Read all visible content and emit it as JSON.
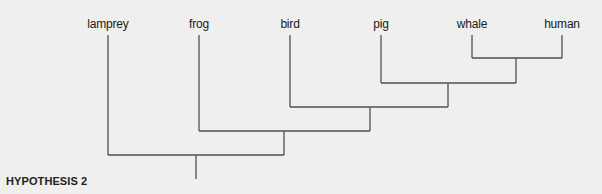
{
  "diagram": {
    "type": "cladogram",
    "caption": "HYPOTHESIS 2",
    "taxa": [
      {
        "name": "lamprey",
        "x": 108
      },
      {
        "name": "frog",
        "x": 199
      },
      {
        "name": "bird",
        "x": 290
      },
      {
        "name": "pig",
        "x": 381
      },
      {
        "name": "whale",
        "x": 472
      },
      {
        "name": "human",
        "x": 562
      }
    ],
    "clades": [
      {
        "members": [
          "whale",
          "human"
        ]
      },
      {
        "members": [
          "pig",
          "whale",
          "human"
        ]
      },
      {
        "members": [
          "bird",
          "pig",
          "whale",
          "human"
        ]
      },
      {
        "members": [
          "frog",
          "bird",
          "pig",
          "whale",
          "human"
        ]
      },
      {
        "members": [
          "lamprey",
          "frog",
          "bird",
          "pig",
          "whale",
          "human"
        ]
      }
    ],
    "line_color": "#505050",
    "background_color": "#efefed"
  }
}
